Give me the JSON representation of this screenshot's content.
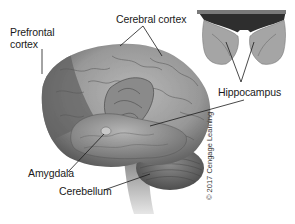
{
  "figure": {
    "labels": {
      "prefrontal_cortex": "Prefrontal\ncortex",
      "prefrontal_line1": "Prefrontal",
      "prefrontal_line2": "cortex",
      "cerebral_cortex": "Cerebral cortex",
      "hippocampus": "Hippocampus",
      "amygdala": "Amygdala",
      "cerebellum": "Cerebellum"
    },
    "credit": "© 2017 Cengage Learning",
    "colors": {
      "background": "#ffffff",
      "brain_light": "#a9a9a9",
      "brain_mid": "#8a8a8a",
      "brain_dark": "#5e5e5e",
      "prefrontal_shade": "#6f6f6f",
      "leader_line": "#1a1a1a",
      "label_text": "#1a1a1a"
    },
    "views": [
      {
        "name": "lateral-brain-view",
        "description": "Side view of whole brain"
      },
      {
        "name": "hippocampus-inset",
        "description": "Inset view of hippocampus pair"
      }
    ]
  }
}
